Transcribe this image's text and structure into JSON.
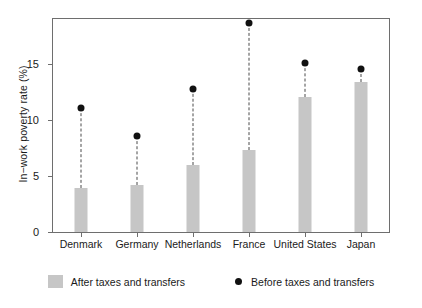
{
  "chart_data": {
    "type": "bar",
    "title": "",
    "xlabel": "",
    "ylabel": "In−work poverty rate (%)",
    "categories": [
      "Denmark",
      "Germany",
      "Netherlands",
      "France",
      "United States",
      "Japan"
    ],
    "series": [
      {
        "name": "After taxes and transfers",
        "marker": "bar",
        "color": "#c6c6c6",
        "values": [
          3.9,
          4.2,
          6.0,
          7.3,
          12.0,
          13.4
        ]
      },
      {
        "name": "Before taxes and transfers",
        "marker": "dot",
        "color": "#111111",
        "values": [
          11.1,
          8.6,
          12.8,
          18.6,
          15.1,
          14.5
        ]
      }
    ],
    "ylim": [
      0,
      19
    ],
    "yticks": [
      0,
      5,
      10,
      15
    ],
    "ytick_labels": [
      "0",
      "5",
      "10",
      "15"
    ],
    "grid": false,
    "legend_position": "bottom"
  },
  "legend": {
    "items": [
      {
        "label": "After taxes and transfers",
        "icon": "gray-square-swatch"
      },
      {
        "label": "Before taxes and transfers",
        "icon": "black-dot-marker"
      }
    ]
  }
}
